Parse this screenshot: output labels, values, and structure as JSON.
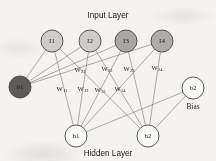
{
  "figure": {
    "type": "neural-network-diagram",
    "background_color": "#f4f3f1",
    "titles": {
      "input_layer": "Input Layer",
      "hidden_layer": "Hidden Layer",
      "bias_caption": "Bias"
    }
  },
  "nodes": {
    "input": [
      {
        "id": "I1",
        "label": "I1",
        "cx": 52,
        "cy": 41,
        "r": 11,
        "fill": "#cfcdc9"
      },
      {
        "id": "I2",
        "label": "I2",
        "cx": 90,
        "cy": 41,
        "r": 11,
        "fill": "#cfcdc9"
      },
      {
        "id": "I3",
        "label": "I3",
        "cx": 126,
        "cy": 41,
        "r": 11,
        "fill": "#a9a7a3"
      },
      {
        "id": "I4",
        "label": "I4",
        "cx": 162,
        "cy": 41,
        "r": 11,
        "fill": "#aeaca8"
      }
    ],
    "hidden": [
      {
        "id": "h1",
        "label": "h1",
        "cx": 76,
        "cy": 136,
        "r": 11,
        "fill": "#fbfbfa"
      },
      {
        "id": "h2",
        "label": "h2",
        "cx": 148,
        "cy": 136,
        "r": 11,
        "fill": "#fbfbfa"
      }
    ],
    "bias": [
      {
        "id": "b1",
        "label": "b1",
        "cx": 20,
        "cy": 87,
        "r": 11,
        "fill": "#5e5c5a"
      },
      {
        "id": "b2",
        "label": "b2",
        "cx": 193,
        "cy": 88,
        "r": 11,
        "fill": "#fbfbfa"
      }
    ]
  },
  "weights": [
    {
      "id": "w21",
      "base": "W",
      "sub": "21",
      "x": 80,
      "y": 69
    },
    {
      "id": "w22",
      "base": "W",
      "sub": "22",
      "x": 107,
      "y": 68
    },
    {
      "id": "w23",
      "base": "W",
      "sub": "23",
      "x": 129,
      "y": 68
    },
    {
      "id": "w24",
      "base": "W",
      "sub": "24",
      "x": 157,
      "y": 67
    },
    {
      "id": "w11",
      "base": "W",
      "sub": "11",
      "x": 62,
      "y": 88
    },
    {
      "id": "w12",
      "base": "W",
      "sub": "12",
      "x": 83,
      "y": 88
    },
    {
      "id": "w13",
      "base": "W",
      "sub": "13",
      "x": 100,
      "y": 89
    },
    {
      "id": "w14",
      "base": "W",
      "sub": "14",
      "x": 120,
      "y": 88
    }
  ],
  "edges": {
    "input_to_hidden": [
      {
        "from": "I1",
        "to": "h1"
      },
      {
        "from": "I1",
        "to": "h2"
      },
      {
        "from": "I2",
        "to": "h1"
      },
      {
        "from": "I2",
        "to": "h2"
      },
      {
        "from": "I3",
        "to": "h1"
      },
      {
        "from": "I3",
        "to": "h2"
      },
      {
        "from": "I4",
        "to": "h1"
      },
      {
        "from": "I4",
        "to": "h2"
      }
    ],
    "bias1_to_inputs": [
      {
        "from": "b1",
        "to": "I1"
      },
      {
        "from": "b1",
        "to": "I2"
      },
      {
        "from": "b1",
        "to": "I3"
      },
      {
        "from": "b1",
        "to": "I4"
      }
    ],
    "bias2_to_hidden": [
      {
        "from": "b2",
        "to": "h1"
      },
      {
        "from": "b2",
        "to": "h2"
      }
    ]
  },
  "labels": {
    "input_layer": {
      "x": 108,
      "y": 15
    },
    "hidden_layer": {
      "x": 108,
      "y": 153
    },
    "bias_caption": {
      "x": 193,
      "y": 106
    }
  }
}
